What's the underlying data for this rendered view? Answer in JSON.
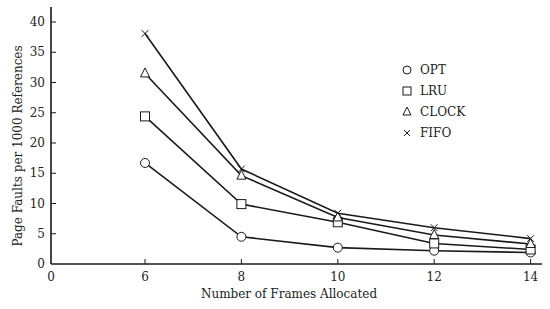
{
  "chart_data": {
    "type": "line",
    "title": "",
    "xlabel": "Number of Frames Allocated",
    "ylabel": "Page Faults per 1000 References",
    "x_ticks": [
      "0",
      "6",
      "8",
      "10",
      "12",
      "14"
    ],
    "y_ticks": [
      "0",
      "5",
      "10",
      "15",
      "20",
      "25",
      "30",
      "35",
      "40"
    ],
    "ylim": [
      0,
      40
    ],
    "x": [
      6,
      8,
      10,
      12,
      14
    ],
    "grid": false,
    "legend_position": "top-right",
    "series": [
      {
        "name": "OPT",
        "marker": "circle",
        "values": [
          16.7,
          4.5,
          2.7,
          2.2,
          1.9
        ]
      },
      {
        "name": "LRU",
        "marker": "square",
        "values": [
          24.4,
          9.9,
          6.9,
          3.4,
          2.4
        ]
      },
      {
        "name": "CLOCK",
        "marker": "triangle",
        "values": [
          31.5,
          14.6,
          7.7,
          4.8,
          3.3
        ]
      },
      {
        "name": "FIFO",
        "marker": "cross",
        "values": [
          38.1,
          15.7,
          8.4,
          6.0,
          4.2
        ]
      }
    ]
  }
}
